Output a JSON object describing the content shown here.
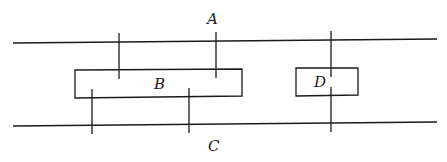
{
  "diagram": {
    "labels": {
      "A": "A",
      "B": "B",
      "C": "C",
      "D": "D"
    },
    "colors": {
      "stroke": "#1a1a1a",
      "background": "#ffffff"
    },
    "elements": [
      {
        "id": "A",
        "kind": "line",
        "description": "upper long horizontal line"
      },
      {
        "id": "C",
        "kind": "line",
        "description": "lower long horizontal line"
      },
      {
        "id": "B",
        "kind": "rectangle",
        "description": "wide rectangle between lines, left-center"
      },
      {
        "id": "D",
        "kind": "rectangle",
        "description": "small rectangle between lines, right"
      }
    ]
  }
}
